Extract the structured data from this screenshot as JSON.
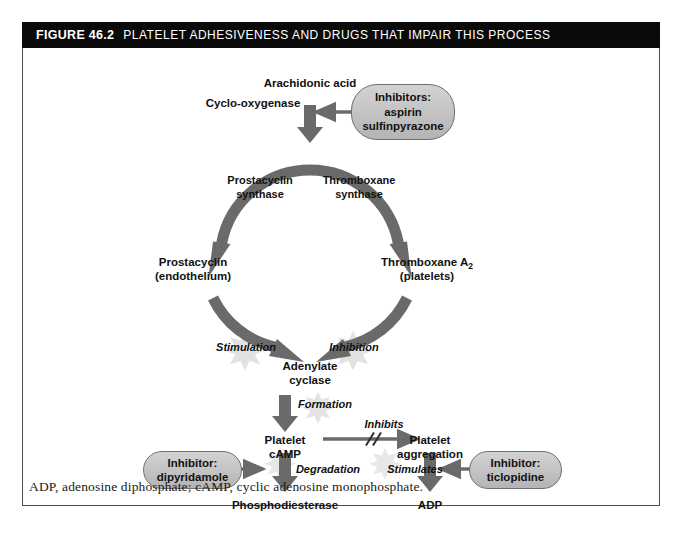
{
  "figure": {
    "number": "FIGURE 46.2",
    "title": "PLATELET ADHESIVENESS AND DRUGS THAT IMPAIR THIS PROCESS",
    "footnote": "ADP, adenosine diphosphate; cAMP, cyclic adenosine monophosphate."
  },
  "nodes": {
    "arachidonic_acid": "Arachidonic acid",
    "cyclo_oxygenase": "Cyclo-oxygenase",
    "prostacyclin_synthase_l1": "Prostacyclin",
    "prostacyclin_synthase_l2": "synthase",
    "thromboxane_synthase_l1": "Thromboxane",
    "thromboxane_synthase_l2": "synthase",
    "prostacyclin_l1": "Prostacyclin",
    "prostacyclin_l2": "(endothelium)",
    "thromboxane_l1": "Thromboxane A",
    "thromboxane_sub": "2",
    "thromboxane_l2": "(platelets)",
    "adenylate_cyclase_l1": "Adenylate",
    "adenylate_cyclase_l2": "cyclase",
    "platelet_camp_l1": "Platelet",
    "platelet_camp_l2": "cAMP",
    "platelet_aggregation_l1": "Platelet",
    "platelet_aggregation_l2": "aggregation",
    "phosphodiesterase": "Phosphodiesterase",
    "adp": "ADP"
  },
  "edge_labels": {
    "stimulation": "Stimulation",
    "inhibition": "Inhibition",
    "formation": "Formation",
    "inhibits": "Inhibits",
    "degradation": "Degradation",
    "stimulates": "Stimulates"
  },
  "inhibitor_boxes": [
    {
      "id": "aspirin-box",
      "line1": "Inhibitors:",
      "line2": "aspirin",
      "line3": "sulfinpyrazone"
    },
    {
      "id": "dipyridamole-box",
      "line1": "Inhibitor:",
      "line2": "dipyridamole",
      "line3": ""
    },
    {
      "id": "ticlopidine-box",
      "line1": "Inhibitor:",
      "line2": "ticlopidine",
      "line3": ""
    }
  ],
  "colors": {
    "title_bar_bg": "#0a0a0a",
    "title_bar_fg": "#ffffff",
    "arrow_gray": "#6a6a6a",
    "arrow_gray_dark": "#595959",
    "pill_fill": "#c6c6c6",
    "pill_border": "#6f6f6f",
    "starburst": "#e0e0e0",
    "panel_border": "#4c4c4c",
    "text": "#111111"
  }
}
